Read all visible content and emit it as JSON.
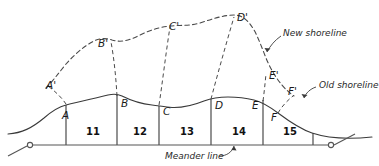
{
  "figure": {
    "stroke_color": "#3a3a3a",
    "dashed_color": "#4a4a4a",
    "text_color": "#1a1a1a"
  },
  "annotations": {
    "new_shoreline": "New shoreline",
    "old_shoreline": "Old shoreline",
    "meander_line": "Meander line"
  },
  "old_shore_points": [
    {
      "label": "A",
      "x": 66,
      "y": 108
    },
    {
      "label": "B",
      "x": 120,
      "y": 99
    },
    {
      "label": "C",
      "x": 162,
      "y": 105
    },
    {
      "label": "D",
      "x": 214,
      "y": 101
    },
    {
      "label": "E",
      "x": 252,
      "y": 101
    },
    {
      "label": "F",
      "x": 278,
      "y": 113
    }
  ],
  "new_shore_points": [
    {
      "label": "A'",
      "x": 52,
      "y": 78
    },
    {
      "label": "B'",
      "x": 100,
      "y": 41
    },
    {
      "label": "C'",
      "x": 172,
      "y": 25
    },
    {
      "label": "D'",
      "x": 240,
      "y": 17
    },
    {
      "label": "E'",
      "x": 268,
      "y": 75
    },
    {
      "label": "F'",
      "x": 288,
      "y": 91
    }
  ],
  "parcels": [
    {
      "number": "11",
      "x": 91,
      "y": 131
    },
    {
      "number": "12",
      "x": 138,
      "y": 131
    },
    {
      "number": "13",
      "x": 185,
      "y": 131
    },
    {
      "number": "14",
      "x": 237,
      "y": 131
    },
    {
      "number": "15",
      "x": 295,
      "y": 131
    }
  ],
  "lot_lines": [
    {
      "name": "lot-line-A",
      "x": 66
    },
    {
      "name": "lot-line-B",
      "x": 117
    },
    {
      "name": "lot-line-C",
      "x": 159
    },
    {
      "name": "lot-line-D",
      "x": 211
    },
    {
      "name": "lot-line-E",
      "x": 263
    },
    {
      "name": "lot-line-end",
      "x": 313
    }
  ],
  "meander": {
    "y": 145,
    "left_node_x": 30,
    "right_node_x": 331,
    "left_tail_x": 8,
    "right_tail_x": 355
  }
}
